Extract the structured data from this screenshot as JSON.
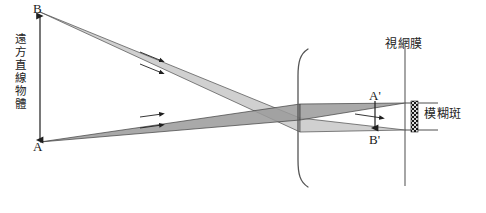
{
  "figure": {
    "title_visible": false,
    "background_color": "#ffffff",
    "line_color": "#333333",
    "bundle_fill_light": "#c9c9c9",
    "bundle_fill_dark": "#8d8d8d",
    "width": 486,
    "height": 213
  },
  "labels": {
    "object_top_point": "B",
    "object_bottom_point": "A",
    "image_top_point": "A'",
    "image_bottom_point": "B'",
    "object_caption": "遠方直線物體",
    "retina_caption": "視網膜",
    "blur_caption": "模糊斑"
  },
  "geometry": {
    "object_axis_x": 40,
    "object_top_y": 12,
    "object_bottom_y": 142,
    "lens_x": 300,
    "lens_top_y": 48,
    "lens_bottom_y": 188,
    "retina_x": 405,
    "retina_top_y": 47,
    "retina_bottom_y": 186,
    "image_top_y": 103,
    "image_bottom_y": 130,
    "blur_bar_x": 414,
    "blur_bar_top_y": 103,
    "blur_bar_bottom_y": 130
  },
  "elements": {
    "bundle_from_b": "ray-bundle-from-b",
    "bundle_from_a": "ray-bundle-from-a",
    "lens_bracket": "lens-bracket",
    "retina_line": "retina-line",
    "blur_bar": "blur-spot-bar",
    "image_arrow": "image-height-arrow"
  }
}
